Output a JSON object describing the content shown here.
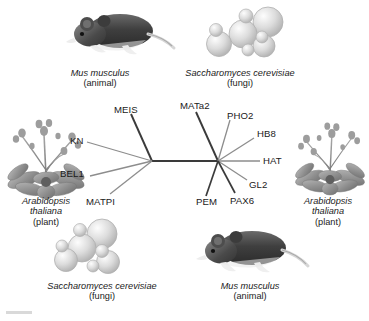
{
  "figure": {
    "type": "unrooted-phylogenetic-tree"
  },
  "organisms": [
    {
      "id": "mouse-top",
      "icon": "mouse-illustration",
      "species": "Mus musculus",
      "group": "(animal)"
    },
    {
      "id": "yeast-top",
      "icon": "yeast-cells-illustration",
      "species": "Saccharomyces cerevisiae",
      "group": "(fungi)"
    },
    {
      "id": "plant-left",
      "icon": "arabidopsis-plant-illustration",
      "species_line1": "Arabidopsis",
      "species_line2": "thaliana",
      "group": "(plant)"
    },
    {
      "id": "plant-right",
      "icon": "arabidopsis-plant-illustration",
      "species_line1": "Arabidopsis",
      "species_line2": "thaliana",
      "group": "(plant)"
    },
    {
      "id": "yeast-bottom",
      "icon": "yeast-cells-illustration",
      "species": "Saccharomyces cerevisiae",
      "group": "(fungi)"
    },
    {
      "id": "mouse-bottom",
      "icon": "mouse-illustration",
      "species": "Mus musculus",
      "group": "(animal)"
    }
  ],
  "tree": {
    "nodes": {
      "left_internal": {
        "x": 152,
        "y": 161
      },
      "right_internal": {
        "x": 218,
        "y": 161
      }
    },
    "trunk": {
      "from": "left_internal",
      "to": "right_internal",
      "color": "#3a3a3a"
    },
    "leaves": [
      {
        "label": "MEIS",
        "node": "left_internal",
        "tip_x": 131,
        "tip_y": 114,
        "color": "#3b3b3b"
      },
      {
        "label": "KN",
        "node": "left_internal",
        "tip_x": 87,
        "tip_y": 142,
        "color": "#8d8d8d"
      },
      {
        "label": "BEL1",
        "node": "left_internal",
        "tip_x": 90,
        "tip_y": 176,
        "color": "#8d8d8d"
      },
      {
        "label": "MATPI",
        "node": "left_internal",
        "tip_x": 110,
        "tip_y": 194,
        "color": "#8d8d8d"
      },
      {
        "label": "MATa2",
        "node": "right_internal",
        "tip_x": 196,
        "tip_y": 112,
        "color": "#3b3b3b"
      },
      {
        "label": "PHO2",
        "node": "right_internal",
        "tip_x": 230,
        "tip_y": 120,
        "color": "#8d8d8d"
      },
      {
        "label": "HB8",
        "node": "right_internal",
        "tip_x": 254,
        "tip_y": 138,
        "color": "#8d8d8d"
      },
      {
        "label": "HAT",
        "node": "right_internal",
        "tip_x": 260,
        "tip_y": 161,
        "color": "#8d8d8d"
      },
      {
        "label": "GL2",
        "node": "right_internal",
        "tip_x": 247,
        "tip_y": 180,
        "color": "#8d8d8d"
      },
      {
        "label": "PAX6",
        "node": "right_internal",
        "tip_x": 235,
        "tip_y": 193,
        "color": "#3b3b3b"
      },
      {
        "label": "PEM",
        "node": "right_internal",
        "tip_x": 206,
        "tip_y": 196,
        "color": "#3b3b3b"
      }
    ]
  },
  "genes": {
    "meis": "MEIS",
    "kn": "KN",
    "bel1": "BEL1",
    "matpi": "MATPI",
    "mata2": "MATa2",
    "pho2": "PHO2",
    "hb8": "HB8",
    "hat": "HAT",
    "gl2": "GL2",
    "pax6": "PAX6",
    "pem": "PEM"
  },
  "colors": {
    "background": "#ffffff",
    "text": "#1a1a1a",
    "branch_dark": "#3b3b3b",
    "branch_light": "#8d8d8d",
    "mouse_body": "#4a4a4a",
    "yeast_cell": "#d8d8d8",
    "plant_leaf": "#9a9a9a"
  }
}
